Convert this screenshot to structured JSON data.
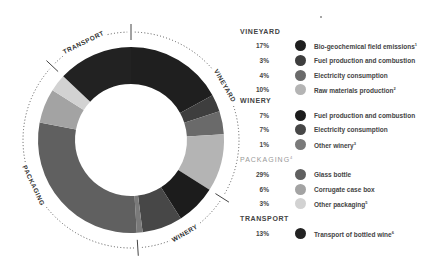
{
  "chart_data": {
    "type": "pie",
    "subtype": "donut",
    "title": "",
    "start_angle_deg": 0,
    "direction": "clockwise",
    "groups": [
      {
        "name": "VINEYARD",
        "ring_label": "VINEYARD",
        "total": 34,
        "items": [
          {
            "pct": 17,
            "value_label": "17%",
            "label": "Bio-geochemical field emissions",
            "sup": "1",
            "color": "#1f1f1f"
          },
          {
            "pct": 3,
            "value_label": "3%",
            "label": "Fuel production and combustion",
            "sup": "",
            "color": "#3e3e3e"
          },
          {
            "pct": 4,
            "value_label": "4%",
            "label": "Electricity consumption",
            "sup": "",
            "color": "#6a6a6a"
          },
          {
            "pct": 10,
            "value_label": "10%",
            "label": "Raw materials production",
            "sup": "2",
            "color": "#b4b4b4"
          }
        ]
      },
      {
        "name": "WINERY",
        "ring_label": "WINERY",
        "total": 15,
        "items": [
          {
            "pct": 7,
            "value_label": "7%",
            "label": "Fuel production and combustion",
            "sup": "",
            "color": "#1c1c1c"
          },
          {
            "pct": 7,
            "value_label": "7%",
            "label": "Electricity consumption",
            "sup": "",
            "color": "#474747"
          },
          {
            "pct": 1,
            "value_label": "1%",
            "label": "Other winery",
            "sup": "3",
            "color": "#7a7a7a"
          }
        ]
      },
      {
        "name": "PACKAGING",
        "name_sup": "4",
        "ring_label": "PACKAGING",
        "total": 38,
        "items": [
          {
            "pct": 29,
            "value_label": "29%",
            "label": "Glass bottle",
            "sup": "",
            "color": "#606060"
          },
          {
            "pct": 6,
            "value_label": "6%",
            "label": "Corrugate case box",
            "sup": "",
            "color": "#a3a3a3"
          },
          {
            "pct": 3,
            "value_label": "3%",
            "label": "Other packaging",
            "sup": "5",
            "color": "#d2d2d2"
          }
        ]
      },
      {
        "name": "TRANSPORT",
        "ring_label": "TRANSPORT",
        "total": 13,
        "items": [
          {
            "pct": 13,
            "value_label": "13%",
            "label": "Transport of bottled wine",
            "sup": "6",
            "color": "#222222"
          }
        ]
      }
    ],
    "legend_position": "right"
  },
  "legend": {
    "vineyard_title": "VINEYARD",
    "winery_title": "WINERY",
    "packaging_title": "PACKAGING",
    "packaging_sup": "4",
    "transport_title": "TRANSPORT",
    "rows": [
      {
        "pct": "17%",
        "label": "Bio-geochemical field emissions",
        "sup": "1"
      },
      {
        "pct": "3%",
        "label": "Fuel production and combustion",
        "sup": ""
      },
      {
        "pct": "4%",
        "label": "Electricity consumption",
        "sup": ""
      },
      {
        "pct": "10%",
        "label": "Raw materials production",
        "sup": "2"
      },
      {
        "pct": "7%",
        "label": "Fuel production and combustion",
        "sup": ""
      },
      {
        "pct": "7%",
        "label": "Electricity consumption",
        "sup": ""
      },
      {
        "pct": "1%",
        "label": "Other winery",
        "sup": "3"
      },
      {
        "pct": "29%",
        "label": "Glass bottle",
        "sup": ""
      },
      {
        "pct": "6%",
        "label": "Corrugate case box",
        "sup": ""
      },
      {
        "pct": "3%",
        "label": "Other packaging",
        "sup": "5"
      },
      {
        "pct": "13%",
        "label": "Transport of bottled wine",
        "sup": "6"
      }
    ]
  }
}
